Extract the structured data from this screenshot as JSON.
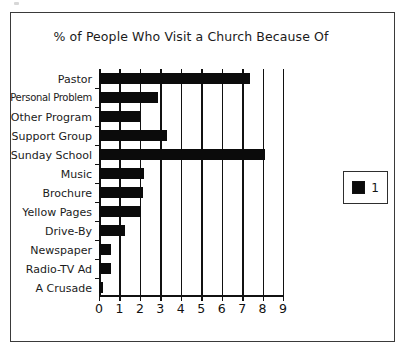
{
  "figure": {
    "title": "% of People Who Visit a Church Because Of"
  },
  "legend": {
    "entries": [
      {
        "label": "1",
        "color": "#0b0b0b",
        "swatch": "filled-square-swatch"
      }
    ]
  },
  "axis": {
    "x_ticklabels": [
      "0",
      "1",
      "2",
      "3",
      "4",
      "5",
      "6",
      "7",
      "8",
      "9"
    ]
  },
  "chart_data": {
    "type": "bar",
    "orientation": "horizontal",
    "title": "% of People Who Visit a Church Because Of",
    "xlabel": "",
    "ylabel": "",
    "xlim": [
      0,
      9
    ],
    "xticks": [
      0,
      1,
      2,
      3,
      4,
      5,
      6,
      7,
      8,
      9
    ],
    "grid": "vertical",
    "legend_position": "right-outside",
    "categories": [
      "Pastor",
      "Personal Problem",
      "Other Program",
      "Support Group",
      "Sunday School",
      "Music",
      "Brochure",
      "Yellow Pages",
      "Drive-By",
      "Newspaper",
      "Radio-TV Ad",
      "A Crusade"
    ],
    "series": [
      {
        "name": "1",
        "color": "#0b0b0b",
        "values": [
          7.4,
          2.9,
          2.0,
          3.35,
          8.1,
          2.2,
          2.15,
          2.05,
          1.25,
          0.6,
          0.6,
          0.2
        ]
      }
    ]
  }
}
